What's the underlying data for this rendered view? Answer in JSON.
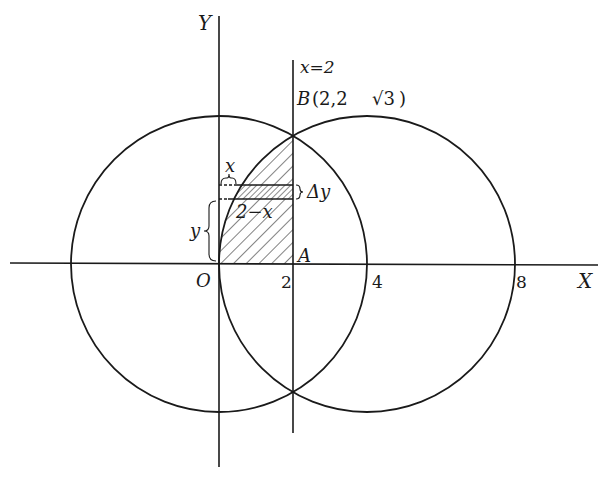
{
  "figure": {
    "axes": {
      "x_label": "X",
      "y_label": "Y",
      "origin_label": "O"
    },
    "ticks": {
      "x2": "2",
      "x4": "4",
      "x8": "8"
    },
    "line_label": "x=2",
    "point_B": {
      "name": "B",
      "coords": "(2,2",
      "sqrt": "√3",
      "close": ")"
    },
    "point_A": "A",
    "strip_labels": {
      "x": "x",
      "width": "2−x",
      "dy": "Δy",
      "y": "y"
    },
    "circles": [
      {
        "center": [
          0,
          0
        ],
        "radius": 4
      },
      {
        "center": [
          4,
          0
        ],
        "radius": 4
      }
    ],
    "intersection_points": [
      "(2, 2√3)",
      "(2, -2√3)"
    ],
    "colors": {
      "ink": "#1a1a1a",
      "background": "#ffffff"
    }
  }
}
